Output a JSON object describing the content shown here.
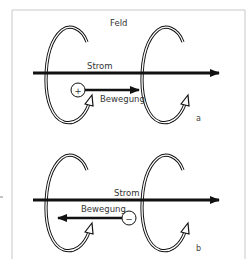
{
  "figure": {
    "colors": {
      "frame": "#c8c8c8",
      "ink": "#111111",
      "text": "#333333"
    },
    "field_label": "Feld",
    "panels": [
      {
        "id": "a",
        "label": "a",
        "current_label": "Strom",
        "motion_label": "Bewegung",
        "charge_symbol": "+",
        "motion_direction": "right"
      },
      {
        "id": "b",
        "label": "b",
        "current_label": "Strom",
        "motion_label": "Bewegung",
        "charge_symbol": "−",
        "motion_direction": "left"
      }
    ]
  }
}
